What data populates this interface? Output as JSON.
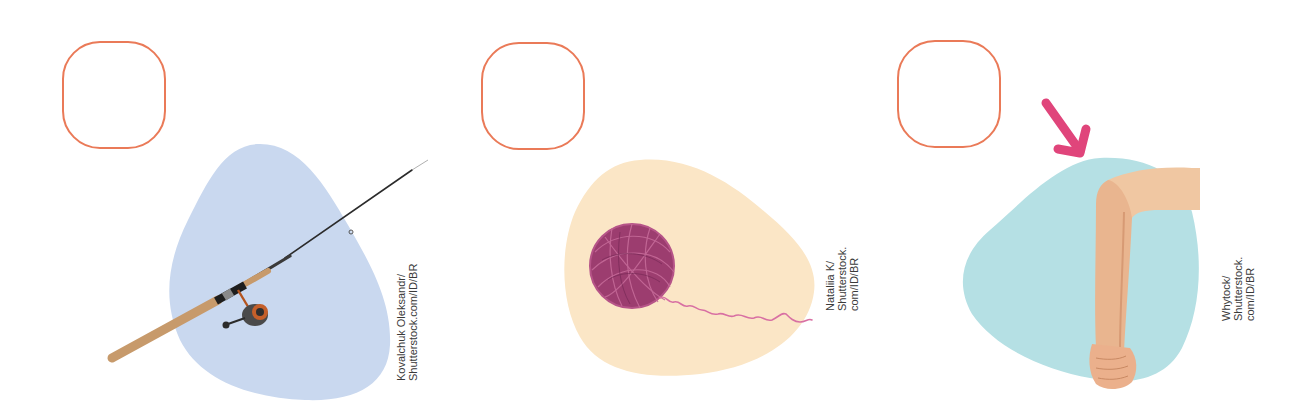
{
  "page": {
    "background": "#ffffff",
    "answer_box_color": "#ea7a58",
    "arrow_color": "#e0457b"
  },
  "items": [
    {
      "id": "fishing-rod",
      "subject": "fishing rod with reel",
      "answer_box": {
        "value": ""
      },
      "blob_color": "#c9d8ef",
      "credit": {
        "line1": "Kovalchuk Oleksandr/",
        "line2": "Shutterstock.com/ID/BR"
      }
    },
    {
      "id": "ball-of-yarn",
      "subject": "ball of yarn",
      "answer_box": {
        "value": ""
      },
      "blob_color": "#fbe6c6",
      "credit": {
        "line1": "Nataliia K/",
        "line2": "Shutterstock.",
        "line3": "com/ID/BR"
      }
    },
    {
      "id": "bent-arm",
      "subject": "bent arm with arrow pointing at elbow",
      "answer_box": {
        "value": ""
      },
      "blob_color": "#b5e0e4",
      "credit": {
        "line1": "Whytock/",
        "line2": "Shutterstock.",
        "line3": "com/ID/BR"
      }
    }
  ]
}
